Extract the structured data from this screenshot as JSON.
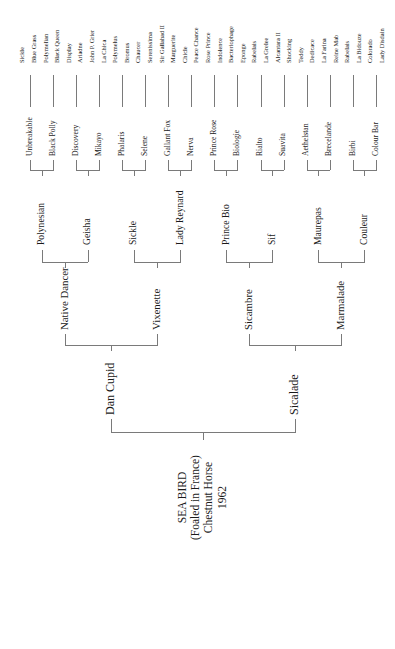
{
  "subject": {
    "name": "SEA BIRD",
    "lines": [
      "SEA BIRD",
      "(Foaled in France)",
      "Chestnut Horse",
      "1962"
    ]
  },
  "generations": {
    "gen1": [
      "Dan Cupid",
      "Sicalade"
    ],
    "gen2": [
      "Native Dancer",
      "Vixenette",
      "Sicambre",
      "Marmalade"
    ],
    "gen3": [
      "Polynesian",
      "Geisha",
      "Sickle",
      "Lady Reynard",
      "Prince Bio",
      "Sif",
      "Maurepas",
      "Couleur"
    ],
    "gen4": [
      "Unbreakable",
      "Black Polly",
      "Discovery",
      "Mikayo",
      "Phalaris",
      "Selene",
      "Gallant Fox",
      "Nerva",
      "Prince Rose",
      "Biologie",
      "Rialto",
      "Suavita",
      "Aethelstan",
      "Brecelande",
      "Birbi",
      "Colour Bar"
    ],
    "gen5": [
      "Sickle",
      "Blue Grass",
      "Polymelian",
      "Black Queen",
      "Display",
      "Ariadne",
      "John P. Grier",
      "La Chica",
      "Polymelus",
      "Bromus",
      "Chaucer",
      "Serenissima",
      "Sir Gallahad II",
      "Marguerite",
      "Chicle",
      "Peace Chance",
      "Rose Prince",
      "Indolence",
      "Bacteriophage",
      "Eponge",
      "Rabelais",
      "La Grelee",
      "Alcantara II",
      "Shocking",
      "Teddy",
      "Dedicace",
      "La Farina",
      "Reine Mab",
      "Rabelais",
      "La Bidouze",
      "Colorado",
      "Lady Disdain"
    ]
  },
  "style": {
    "line_color": "#7a7a7a",
    "text_color": "#1a1a1a",
    "background": "#ffffff"
  }
}
